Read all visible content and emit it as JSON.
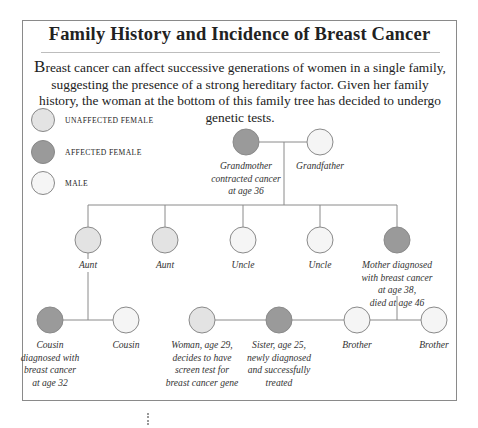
{
  "title": "Family History and Incidence of Breast Cancer",
  "intro": {
    "dropcap": "B",
    "text": "reast cancer can affect successive generations of women in a single family, suggesting the presence of a strong hereditary factor. Given her family history, the woman at the bottom of this family tree has decided to undergo genetic tests."
  },
  "colors": {
    "affected_female": "#9a9a9a",
    "unaffected_female": "#e3e3e3",
    "male": "#f5f5f5",
    "stroke": "#8a8a8a",
    "line": "#8a8a8a"
  },
  "legend": [
    {
      "label": "UNAFFECTED FEMALE",
      "type": "unaffected_female"
    },
    {
      "label": "AFFECTED FEMALE",
      "type": "affected_female"
    },
    {
      "label": "MALE",
      "type": "male"
    }
  ],
  "people": {
    "grandmother": {
      "label": "Grandmother contracted cancer at age 36",
      "type": "affected_female"
    },
    "grandfather": {
      "label": "Grandfather",
      "type": "male"
    },
    "aunt1": {
      "label": "Aunt",
      "type": "unaffected_female"
    },
    "aunt2": {
      "label": "Aunt",
      "type": "unaffected_female"
    },
    "uncle1": {
      "label": "Uncle",
      "type": "male"
    },
    "uncle2": {
      "label": "Uncle",
      "type": "male"
    },
    "mother": {
      "label": "Mother diagnosed with breast cancer at age 38, died at age 46",
      "type": "affected_female"
    },
    "cousin_f": {
      "label": "Cousin diagnosed with breast cancer at age 32",
      "type": "affected_female"
    },
    "cousin_m": {
      "label": "Cousin",
      "type": "male"
    },
    "woman": {
      "label": "Woman, age 29, decides to have screen test for breast cancer gene",
      "type": "unaffected_female"
    },
    "sister": {
      "label": "Sister, age 25, newly diagnosed and successfully treated",
      "type": "affected_female"
    },
    "brother1": {
      "label": "Brother",
      "type": "male"
    },
    "brother2": {
      "label": "Brother",
      "type": "male"
    }
  },
  "captions": {
    "grandmother": [
      "Grandmother",
      "contracted cancer",
      "at age 36"
    ],
    "grandfather": [
      "Grandfather"
    ],
    "aunt1": [
      "Aunt"
    ],
    "aunt2": [
      "Aunt"
    ],
    "uncle1": [
      "Uncle"
    ],
    "uncle2": [
      "Uncle"
    ],
    "mother": [
      "Mother diagnosed",
      "with breast cancer",
      "at age 38,",
      "died at age 46"
    ],
    "cousin_f": [
      "Cousin",
      "diagnosed with",
      "breast cancer",
      "at age 32"
    ],
    "cousin_m": [
      "Cousin"
    ],
    "woman": [
      "Woman, age 29,",
      "decides to have",
      "screen test for",
      "breast cancer gene"
    ],
    "sister": [
      "Sister, age 25,",
      "newly diagnosed",
      "and successfully",
      "treated"
    ],
    "brother1": [
      "Brother"
    ],
    "brother2": [
      "Brother"
    ]
  }
}
